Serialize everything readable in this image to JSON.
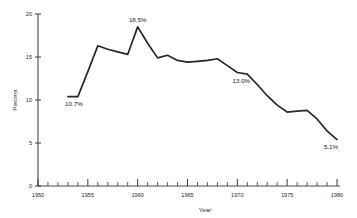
{
  "chart_data": {
    "type": "line",
    "title": "",
    "xlabel": "Year",
    "ylabel": "Percent",
    "xlim": [
      1950,
      1980
    ],
    "ylim": [
      0,
      20
    ],
    "grid": false,
    "legend": "none",
    "x_ticks_major": [
      1950,
      1955,
      1960,
      1965,
      1970,
      1975,
      1980
    ],
    "x_tick_labels": [
      "1950",
      "1955",
      "1960",
      "1965",
      "1970",
      "1975",
      "1980"
    ],
    "x_ticks_minor_step": 1,
    "y_ticks": [
      0,
      5,
      10,
      15,
      20
    ],
    "y_tick_labels": [
      "0",
      "5",
      "10",
      "15",
      "20"
    ],
    "x": [
      1953,
      1954,
      1955,
      1956,
      1957,
      1958,
      1959,
      1960,
      1961,
      1962,
      1963,
      1964,
      1965,
      1966,
      1967,
      1968,
      1969,
      1970,
      1971,
      1972,
      1973,
      1974,
      1975,
      1976,
      1977,
      1978,
      1979,
      1980
    ],
    "values": [
      10.4,
      10.4,
      13.3,
      16.3,
      15.9,
      15.6,
      15.3,
      18.5,
      16.6,
      14.9,
      15.2,
      14.6,
      14.4,
      14.5,
      14.6,
      14.8,
      14.0,
      13.2,
      13.0,
      11.8,
      10.5,
      9.4,
      8.6,
      8.7,
      8.8,
      7.8,
      6.4,
      5.4
    ],
    "annotations": [
      {
        "label": "10.7%",
        "x": 1953.6,
        "y": 10.4,
        "position": "below"
      },
      {
        "label": "18.5%",
        "x": 1960.0,
        "y": 18.5,
        "position": "above"
      },
      {
        "label": "13.0%",
        "x": 1970.4,
        "y": 13.0,
        "position": "below"
      },
      {
        "label": "5.1%",
        "x": 1979.4,
        "y": 5.4,
        "position": "below"
      }
    ],
    "line_color": "#272727",
    "axis_color": "#4a4a4a",
    "background_color": "#ffffff"
  },
  "axes": {
    "y_title": "Percent",
    "x_title": "Year"
  }
}
